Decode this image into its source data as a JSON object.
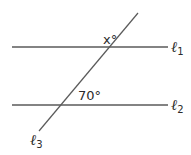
{
  "diagram": {
    "type": "parallel-lines-cut-by-transversal",
    "stroke_color": "#5a5a5a",
    "text_color": "#2b2b2b",
    "lines": [
      {
        "id": "l1",
        "label": "ℓ",
        "subscript": "1",
        "x1": 12,
        "y1": 47,
        "x2": 168,
        "y2": 47
      },
      {
        "id": "l2",
        "label": "ℓ",
        "subscript": "2",
        "x1": 12,
        "y1": 105,
        "x2": 168,
        "y2": 105
      },
      {
        "id": "l3",
        "label": "ℓ",
        "subscript": "3",
        "x1": 138,
        "y1": 13,
        "x2": 39,
        "y2": 131
      }
    ],
    "angles": [
      {
        "id": "angle-x",
        "label": "x°",
        "at_line": "l1"
      },
      {
        "id": "angle-70",
        "label": "70°",
        "at_line": "l2"
      }
    ]
  }
}
